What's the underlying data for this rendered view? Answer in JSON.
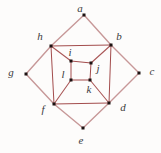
{
  "diagram": {
    "type": "graph",
    "background_color": "#fdfcfb",
    "dot_color": "#1c1212",
    "label_color": "#3b3b3b",
    "edge_groups": {
      "outer": {
        "color": "#c79898",
        "width": 1.4
      },
      "middle": {
        "color": "#a34c4c",
        "width": 1.0
      },
      "spoke": {
        "color": "#aa5858",
        "width": 1.1
      },
      "inner": {
        "color": "#a34c4c",
        "width": 1.0
      }
    },
    "vertices": [
      {
        "id": "a",
        "label": "a",
        "x": 84,
        "y": 15,
        "lx": 80,
        "ly": 8
      },
      {
        "id": "b",
        "label": "b",
        "x": 111,
        "y": 45,
        "lx": 119,
        "ly": 36
      },
      {
        "id": "c",
        "label": "c",
        "x": 139,
        "y": 73,
        "lx": 152,
        "ly": 71
      },
      {
        "id": "d",
        "label": "d",
        "x": 109,
        "y": 103,
        "lx": 123,
        "ly": 107
      },
      {
        "id": "e",
        "label": "e",
        "x": 83,
        "y": 128,
        "lx": 81,
        "ly": 140
      },
      {
        "id": "f",
        "label": "f",
        "x": 54,
        "y": 104,
        "lx": 43,
        "ly": 109
      },
      {
        "id": "g",
        "label": "g",
        "x": 26,
        "y": 74,
        "lx": 11,
        "ly": 72
      },
      {
        "id": "h",
        "label": "h",
        "x": 51,
        "y": 46,
        "lx": 40,
        "ly": 36
      },
      {
        "id": "i",
        "label": "i",
        "x": 71,
        "y": 61,
        "lx": 70,
        "ly": 52
      },
      {
        "id": "j",
        "label": "j",
        "x": 91,
        "y": 63,
        "lx": 98,
        "ly": 68
      },
      {
        "id": "k",
        "label": "k",
        "x": 90,
        "y": 80,
        "lx": 89,
        "ly": 89
      },
      {
        "id": "l",
        "label": "l",
        "x": 71,
        "y": 80,
        "lx": 63,
        "ly": 74
      }
    ],
    "edges": [
      {
        "from": "a",
        "to": "h",
        "group": "outer"
      },
      {
        "from": "a",
        "to": "b",
        "group": "outer"
      },
      {
        "from": "b",
        "to": "c",
        "group": "outer"
      },
      {
        "from": "c",
        "to": "d",
        "group": "outer"
      },
      {
        "from": "d",
        "to": "e",
        "group": "outer"
      },
      {
        "from": "e",
        "to": "f",
        "group": "outer"
      },
      {
        "from": "f",
        "to": "g",
        "group": "outer"
      },
      {
        "from": "g",
        "to": "h",
        "group": "outer"
      },
      {
        "from": "h",
        "to": "b",
        "group": "middle"
      },
      {
        "from": "b",
        "to": "d",
        "group": "middle"
      },
      {
        "from": "d",
        "to": "f",
        "group": "middle"
      },
      {
        "from": "f",
        "to": "h",
        "group": "middle"
      },
      {
        "from": "h",
        "to": "i",
        "group": "spoke"
      },
      {
        "from": "b",
        "to": "j",
        "group": "spoke"
      },
      {
        "from": "d",
        "to": "k",
        "group": "spoke"
      },
      {
        "from": "f",
        "to": "l",
        "group": "spoke"
      },
      {
        "from": "i",
        "to": "j",
        "group": "inner"
      },
      {
        "from": "j",
        "to": "k",
        "group": "inner"
      },
      {
        "from": "k",
        "to": "l",
        "group": "inner"
      },
      {
        "from": "l",
        "to": "i",
        "group": "inner"
      }
    ],
    "dot_size": 3
  }
}
